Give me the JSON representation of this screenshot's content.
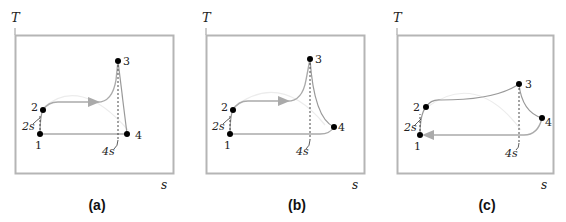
{
  "figure": {
    "type": "T-s diagrams",
    "panels": [
      {
        "id": "a",
        "caption": "(a)",
        "y_axis_label": "T",
        "x_axis_label": "s",
        "points": {
          "1": "1",
          "2": "2",
          "3": "3",
          "4": "4"
        },
        "annotations": {
          "2s": "2s",
          "4s": "4s"
        }
      },
      {
        "id": "b",
        "caption": "(b)",
        "y_axis_label": "T",
        "x_axis_label": "s",
        "points": {
          "1": "1",
          "2": "2",
          "3": "3",
          "4": "4"
        },
        "annotations": {
          "2s": "2s",
          "4s": "4s"
        }
      },
      {
        "id": "c",
        "caption": "(c)",
        "y_axis_label": "T",
        "x_axis_label": "s",
        "points": {
          "1": "1",
          "2": "2",
          "3": "3",
          "4": "4"
        },
        "annotations": {
          "2s": "2s",
          "4s": "4s"
        }
      }
    ]
  },
  "colors": {
    "frame": "#b0b0b0",
    "process_line": "#9a9a9a",
    "faint_line": "#e4e4e4",
    "point": "#000000",
    "arrow": "#a8a8a8"
  }
}
